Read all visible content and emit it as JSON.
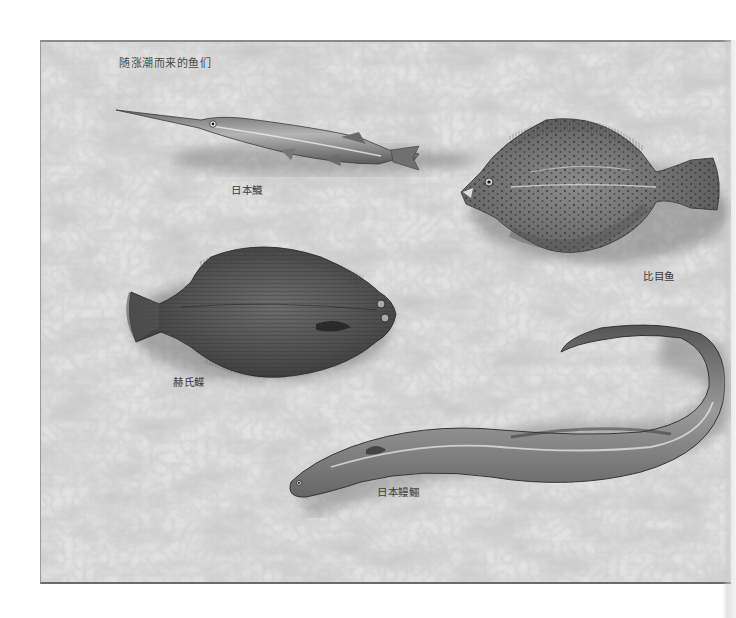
{
  "figure": {
    "title": "随涨潮而来的鱼们",
    "background_color": "#e4e4e4",
    "border_color": "#8a8a8a"
  },
  "fish": [
    {
      "id": "needlefish",
      "label": "日本鱵",
      "position": "top-left"
    },
    {
      "id": "flounder-spotted",
      "label": "比目鱼",
      "position": "top-right"
    },
    {
      "id": "flounder-hers",
      "label": "赫氏鲽",
      "position": "middle-left"
    },
    {
      "id": "eel",
      "label": "日本鳗鲡",
      "position": "bottom"
    }
  ]
}
